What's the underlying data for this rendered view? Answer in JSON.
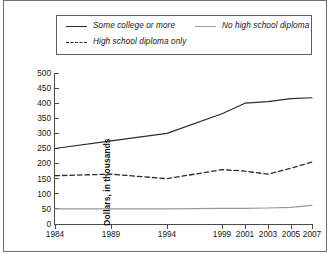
{
  "legend": {
    "position": "top",
    "items": [
      {
        "label": "Some college or more",
        "style": "solid",
        "color": "#2b2b2b",
        "icon": "solid-line-icon"
      },
      {
        "label": "High school diploma only",
        "style": "dashed",
        "color": "#2b2b2b",
        "icon": "dashed-line-icon"
      },
      {
        "label": "No high school diploma",
        "style": "solid-gray",
        "color": "#9a9a9a",
        "icon": "gray-line-icon"
      }
    ]
  },
  "axes": {
    "y_title": "Dollars, in thousands",
    "y_ticks": [
      "500",
      "450",
      "400",
      "350",
      "300",
      "250",
      "200",
      "150",
      "100",
      "50",
      "0"
    ],
    "x_ticks": [
      "1984",
      "1989",
      "1994",
      "1999",
      "2001",
      "2003",
      "2005",
      "2007"
    ]
  },
  "chart_data": {
    "type": "line",
    "title": "",
    "subtitle": "",
    "xlabel": "",
    "ylabel": "Dollars, in thousands",
    "x": [
      1984,
      1989,
      1994,
      1999,
      2001,
      2003,
      2005,
      2007
    ],
    "x_positions_px": [
      0,
      56,
      112,
      167,
      190,
      213,
      236,
      257
    ],
    "xlim": [
      1984,
      2007
    ],
    "ylim": [
      0,
      500
    ],
    "ytick_step": 50,
    "grid": false,
    "legend_position": "top",
    "series": [
      {
        "name": "Some college or more",
        "style": "solid",
        "color": "#2b2b2b",
        "values": [
          250,
          275,
          300,
          365,
          400,
          405,
          415,
          418
        ]
      },
      {
        "name": "High school diploma only",
        "style": "dashed",
        "color": "#2b2b2b",
        "values": [
          160,
          165,
          150,
          180,
          175,
          165,
          185,
          205
        ]
      },
      {
        "name": "No high school diploma",
        "style": "solid",
        "color": "#9a9a9a",
        "values": [
          50,
          50,
          50,
          52,
          52,
          53,
          55,
          62
        ]
      }
    ]
  }
}
